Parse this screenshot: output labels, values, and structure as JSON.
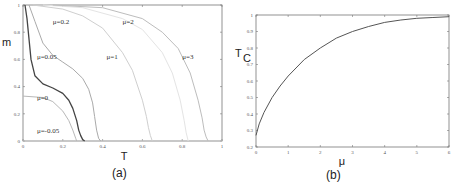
{
  "chart_data": [
    {
      "type": "line",
      "panel": "a",
      "caption": "(a)",
      "title": "",
      "xlabel": "T",
      "ylabel": "m",
      "xlim": [
        0,
        1
      ],
      "ylim": [
        0,
        1
      ],
      "xticks": [
        "0",
        "0.2",
        "0.4",
        "0.6",
        "0.8",
        "1"
      ],
      "yticks": [
        "0",
        "0.2",
        "0.4",
        "0.6",
        "0.8",
        "1"
      ],
      "grid": false,
      "series": [
        {
          "name": "μ=-0.05",
          "color": "#c8c8c8",
          "x": [
            0,
            1
          ],
          "y": [
            0,
            0
          ]
        },
        {
          "name": "μ=0",
          "color": "#b8b8b8",
          "x": [
            0,
            0.1,
            0.15,
            0.2,
            0.23,
            0.25,
            0.265,
            0.27
          ],
          "y": [
            0.33,
            0.32,
            0.29,
            0.22,
            0.15,
            0.08,
            0.02,
            0
          ]
        },
        {
          "name": "μ=0.05",
          "color": "#444444",
          "x": [
            0.01,
            0.02,
            0.04,
            0.06,
            0.1,
            0.15,
            0.2,
            0.23,
            0.25,
            0.27,
            0.28,
            0.29,
            0.3,
            0.31
          ],
          "y": [
            1,
            0.9,
            0.6,
            0.48,
            0.42,
            0.39,
            0.35,
            0.3,
            0.24,
            0.15,
            0.08,
            0.04,
            0.01,
            0
          ]
        },
        {
          "name": "μ=0.2",
          "color": "#aaaaaa",
          "x": [
            0.03,
            0.06,
            0.1,
            0.15,
            0.2,
            0.25,
            0.3,
            0.33,
            0.35,
            0.36,
            0.37,
            0.38,
            0.39
          ],
          "y": [
            1,
            0.88,
            0.72,
            0.63,
            0.58,
            0.53,
            0.46,
            0.38,
            0.28,
            0.18,
            0.08,
            0.02,
            0
          ]
        },
        {
          "name": "μ=1",
          "color": "#cfcfcf",
          "x": [
            0.05,
            0.2,
            0.3,
            0.4,
            0.5,
            0.55,
            0.6,
            0.62,
            0.63,
            0.64,
            0.65
          ],
          "y": [
            1,
            0.97,
            0.92,
            0.83,
            0.65,
            0.52,
            0.3,
            0.18,
            0.1,
            0.04,
            0
          ]
        },
        {
          "name": "μ=2",
          "color": "#e4e4e4",
          "x": [
            0.1,
            0.3,
            0.5,
            0.6,
            0.7,
            0.75,
            0.79,
            0.81,
            0.82,
            0.83
          ],
          "y": [
            1,
            0.98,
            0.9,
            0.82,
            0.65,
            0.5,
            0.3,
            0.15,
            0.06,
            0
          ]
        },
        {
          "name": "μ=3",
          "color": "#bdbdbd",
          "x": [
            0.15,
            0.4,
            0.6,
            0.7,
            0.78,
            0.84,
            0.88,
            0.9,
            0.91,
            0.92,
            0.93
          ],
          "y": [
            1,
            0.98,
            0.9,
            0.8,
            0.68,
            0.5,
            0.3,
            0.17,
            0.08,
            0.03,
            0
          ]
        }
      ],
      "annotations": [
        {
          "text": "μ=0.2",
          "x": 0.15,
          "y": 0.86
        },
        {
          "text": "μ=0.05",
          "x": 0.07,
          "y": 0.6
        },
        {
          "text": "μ=0",
          "x": 0.07,
          "y": 0.3
        },
        {
          "text": "μ=-0.05",
          "x": 0.07,
          "y": 0.06
        },
        {
          "text": "μ=2",
          "x": 0.5,
          "y": 0.86
        },
        {
          "text": "μ=1",
          "x": 0.42,
          "y": 0.6
        },
        {
          "text": "μ=3",
          "x": 0.8,
          "y": 0.6
        }
      ]
    },
    {
      "type": "line",
      "panel": "b",
      "caption": "(b)",
      "title": "",
      "xlabel": "μ",
      "ylabel": "Tc",
      "ylabel_main": "T",
      "ylabel_sub": "C",
      "xlim": [
        0,
        6
      ],
      "ylim": [
        0.2,
        1
      ],
      "xticks": [
        "0",
        "1",
        "2",
        "3",
        "4",
        "5",
        "6"
      ],
      "yticks": [
        "0.2",
        "0.3",
        "0.4",
        "0.5",
        "0.6",
        "0.7",
        "0.8",
        "0.9",
        "1"
      ],
      "grid": false,
      "series": [
        {
          "name": "Tc(μ)",
          "color": "#555555",
          "x": [
            0,
            0.1,
            0.25,
            0.5,
            0.75,
            1,
            1.5,
            2,
            2.5,
            3,
            3.5,
            4,
            4.5,
            5,
            5.5,
            6
          ],
          "y": [
            0.27,
            0.34,
            0.41,
            0.5,
            0.57,
            0.63,
            0.73,
            0.8,
            0.86,
            0.9,
            0.93,
            0.955,
            0.97,
            0.98,
            0.985,
            0.99
          ]
        }
      ]
    }
  ]
}
